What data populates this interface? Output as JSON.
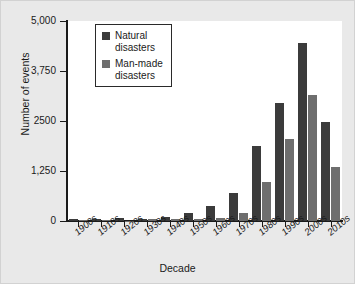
{
  "chart_data": {
    "type": "bar",
    "title": "",
    "xlabel": "Decade",
    "ylabel": "Number of events",
    "categories": [
      "1900s",
      "1910s",
      "1920s",
      "1930s",
      "1940s",
      "1950s",
      "1960s",
      "1970s",
      "1980s",
      "1990s",
      "2000s",
      "2010s"
    ],
    "ylim": [
      0,
      5000
    ],
    "yticks": [
      0,
      1250,
      2500,
      3750,
      5000
    ],
    "ytick_labels": [
      "0",
      "1,250",
      "2500",
      "3,750",
      "5,000"
    ],
    "grid": false,
    "legend_position": "top-left-inside",
    "series": [
      {
        "name": "Natural disasters",
        "color": "#3b3b3b",
        "values": [
          60,
          50,
          75,
          60,
          90,
          200,
          380,
          700,
          1875,
          2950,
          4450,
          2475
        ]
      },
      {
        "name": "Man-made disasters",
        "color": "#6e6e6e",
        "values": [
          15,
          20,
          10,
          40,
          45,
          40,
          65,
          200,
          975,
          2050,
          3150,
          1350
        ]
      }
    ]
  },
  "legend": {
    "items": [
      {
        "label": "Natural\ndisasters",
        "swatch": "natural-disasters-swatch"
      },
      {
        "label": "Man-made\ndisasters",
        "swatch": "man-made-disasters-swatch"
      }
    ]
  }
}
